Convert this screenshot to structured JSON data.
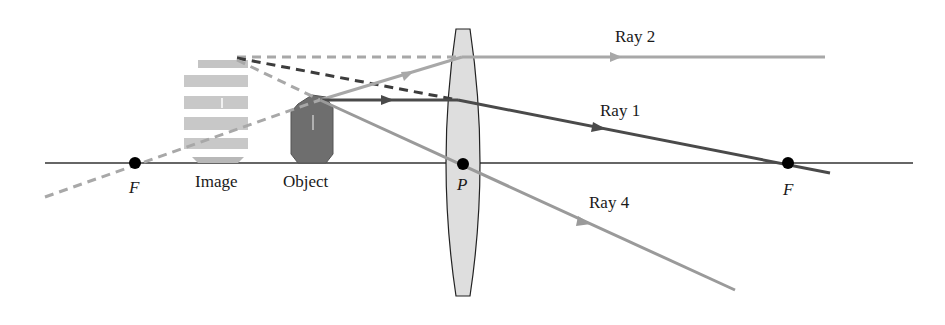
{
  "diagram": {
    "type": "ray-diagram-converging-lens-virtual-image",
    "labels": {
      "ray1": "Ray 1",
      "ray2": "Ray 2",
      "ray4": "Ray 4",
      "focal_left": "F",
      "focal_right": "F",
      "principal_point": "P",
      "image": "Image",
      "object": "Object"
    },
    "colors": {
      "axis": "#333333",
      "ray1": "#4a4a4a",
      "ray2": "#a8a8a8",
      "ray4": "#9a9a9a",
      "dashed_dark": "#3c3c3c",
      "dashed_light": "#a8a8a8",
      "lens_fill": "#dcdcdc",
      "object_fill": "#6e6e6e",
      "image_fill": "#c8c8c8",
      "point": "#000000"
    },
    "geometry": {
      "axis_y": 163,
      "focal_left_x": 135,
      "focal_right_x": 788,
      "lens_center_x": 463,
      "lens_top_y": 29,
      "lens_bottom_y": 296,
      "object_top": [
        320,
        100
      ],
      "image_top": [
        237,
        57
      ]
    }
  }
}
